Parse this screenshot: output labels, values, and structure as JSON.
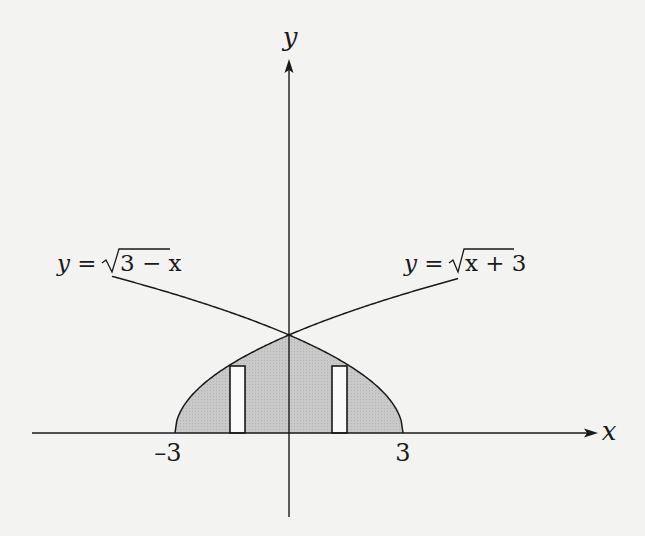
{
  "figure": {
    "axes": {
      "x_label": "x",
      "y_label": "y",
      "tick_labels": [
        {
          "value": -3,
          "text": "–3"
        },
        {
          "value": 3,
          "text": "3"
        }
      ]
    },
    "curves": [
      {
        "name": "left-curve",
        "equation_prefix": "y =",
        "radicand": "3 − x",
        "formula": "y = √(3 − x)"
      },
      {
        "name": "right-curve",
        "equation_prefix": "y =",
        "radicand": "x + 3",
        "formula": "y = √(x + 3)"
      }
    ],
    "shaded_region": "Region bounded by y = √(x + 3), y = √(3 − x) and the x-axis, from x = -3 to x = 3",
    "strips": [
      {
        "name": "left-strip",
        "x_from": -1.55,
        "x_to": -1.15
      },
      {
        "name": "right-strip",
        "x_from": 1.11,
        "x_to": 1.53
      }
    ],
    "colors": {
      "background": "#f3f3f1",
      "shade": "#c6c6c6",
      "line": "#1a1a1a",
      "strip_fill": "#fafafa"
    }
  },
  "chart_data": {
    "type": "area",
    "title": "",
    "xlabel": "x",
    "ylabel": "y",
    "xlim": [
      -6.7,
      8.3
    ],
    "ylim": [
      -1.5,
      6.8
    ],
    "x_ticks": [
      -3,
      3
    ],
    "series": [
      {
        "name": "y = √(x + 3)",
        "domain": [
          -3,
          4.45
        ],
        "points": [
          [
            -3,
            0
          ],
          [
            -2,
            1
          ],
          [
            -1,
            1.414
          ],
          [
            0,
            1.732
          ],
          [
            1,
            2
          ],
          [
            2,
            2.236
          ],
          [
            3,
            2.449
          ],
          [
            4,
            2.646
          ],
          [
            4.45,
            2.73
          ]
        ]
      },
      {
        "name": "y = √(3 − x)",
        "domain": [
          -4.66,
          3
        ],
        "points": [
          [
            -4.66,
            2.77
          ],
          [
            -4,
            2.646
          ],
          [
            -3,
            2.449
          ],
          [
            -2,
            2.236
          ],
          [
            -1,
            2
          ],
          [
            0,
            1.732
          ],
          [
            1,
            1.414
          ],
          [
            2,
            1
          ],
          [
            3,
            0
          ]
        ]
      }
    ],
    "intersection": [
      0,
      1.732
    ],
    "shaded": {
      "from_x": -3,
      "to_x": 3,
      "upper": "min(√(x+3), √(3−x))",
      "lower": "y = 0"
    },
    "annotations": [
      "y = √(3 − x)",
      "y = √(x + 3)",
      "–3",
      "3"
    ],
    "grid": false,
    "legend": "none"
  }
}
